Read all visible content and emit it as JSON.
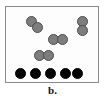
{
  "figure": {
    "caption": "b.",
    "box": {
      "x": 5,
      "y": 6,
      "width": 94,
      "height": 77,
      "border_color": "#8a8a8a",
      "background_color": "#fdfdfd"
    }
  },
  "legend": {
    "gray_particle_color": "#7d7d7d",
    "gray_particle_outline": "#4d4d4d",
    "black_particle_color": "#050505"
  },
  "chart_data": {
    "type": "scatter",
    "title": "b.",
    "xlabel": "",
    "ylabel": "",
    "xlim": [
      5,
      99
    ],
    "ylim": [
      6,
      83
    ],
    "grid": false,
    "legend_position": "none",
    "series": [
      {
        "name": "diatomic-gray-molecules",
        "color": "#7d7d7d",
        "count": 4,
        "radius": 5.5,
        "molecules": [
          {
            "id": "molecule-gray-1",
            "orientation": "diagonal",
            "atoms": [
              {
                "x": 30,
                "y": 20,
                "r": 5.5
              },
              {
                "x": 36,
                "y": 26,
                "r": 5.5
              }
            ]
          },
          {
            "id": "molecule-gray-2",
            "orientation": "vertical",
            "atoms": [
              {
                "x": 81,
                "y": 20,
                "r": 5.5
              },
              {
                "x": 81,
                "y": 29,
                "r": 5.5
              }
            ]
          },
          {
            "id": "molecule-gray-3",
            "orientation": "horizontal",
            "atoms": [
              {
                "x": 52,
                "y": 38,
                "r": 5.5
              },
              {
                "x": 61,
                "y": 38,
                "r": 5.5
              }
            ]
          },
          {
            "id": "molecule-gray-4",
            "orientation": "horizontal",
            "atoms": [
              {
                "x": 38,
                "y": 54,
                "r": 5.5
              },
              {
                "x": 47,
                "y": 54,
                "r": 5.5
              }
            ]
          }
        ]
      },
      {
        "name": "monatomic-black-particles",
        "color": "#050505",
        "count": 5,
        "radius": 5.5,
        "atoms": [
          {
            "id": "particle-black-1",
            "x": 19,
            "y": 72,
            "r": 5.5
          },
          {
            "id": "particle-black-2",
            "x": 34,
            "y": 72,
            "r": 5.5
          },
          {
            "id": "particle-black-3",
            "x": 49,
            "y": 72,
            "r": 5.5
          },
          {
            "id": "particle-black-4",
            "x": 64,
            "y": 72,
            "r": 5.5
          },
          {
            "id": "particle-black-5",
            "x": 76,
            "y": 72,
            "r": 5.5
          }
        ]
      }
    ]
  }
}
